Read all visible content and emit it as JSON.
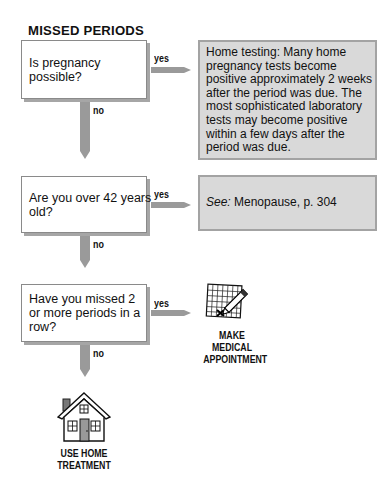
{
  "title": "MISSED PERIODS",
  "nodes": [
    {
      "question_lines": [
        "Is pregnancy",
        "possible?"
      ],
      "yes_label": "yes",
      "no_label": "no",
      "yes_result": {
        "type": "info",
        "lines": [
          "Home testing: Many home",
          "pregnancy tests become",
          "positive approximately 2 weeks",
          "after the period was due. The",
          "most sophisticated laboratory",
          "tests may become positive",
          "within a few days after the",
          "period was due."
        ]
      }
    },
    {
      "question_lines": [
        "Are you over 42 years",
        "old?"
      ],
      "yes_label": "yes",
      "no_label": "no",
      "yes_result": {
        "type": "info",
        "see_label": "See:",
        "text": " Menopause, p. 304"
      }
    },
    {
      "question_lines": [
        "Have you missed 2",
        "or more periods in a",
        "row?"
      ],
      "yes_label": "yes",
      "no_label": "no",
      "yes_result": {
        "type": "action",
        "icon": "calendar-pencil-icon",
        "lines": [
          "MAKE",
          "MEDICAL",
          "APPOINTMENT"
        ]
      }
    }
  ],
  "final_no_result": {
    "type": "action",
    "icon": "house-icon",
    "lines": [
      "USE HOME",
      "TREATMENT"
    ]
  },
  "colors": {
    "arrow": "#9a9a9a",
    "info_fill": "#d9d9d9",
    "info_border": "#a3a3a3",
    "box_shadow": "#a6a6a6"
  }
}
